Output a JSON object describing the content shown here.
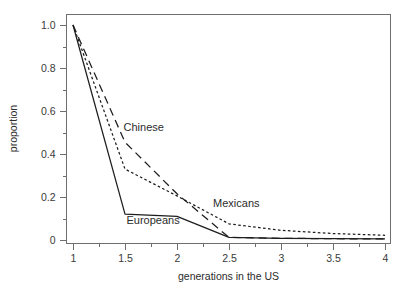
{
  "chart_data": {
    "type": "line",
    "title": "",
    "xlabel": "generations in the US",
    "ylabel": "proportion",
    "xlim": [
      1,
      4
    ],
    "ylim": [
      0,
      1.0
    ],
    "grid": false,
    "legend_position": "inline-annotations",
    "x_ticks": [
      {
        "value": 1,
        "label": "1"
      },
      {
        "value": 1.5,
        "label": "1.5"
      },
      {
        "value": 2,
        "label": "2"
      },
      {
        "value": 2.5,
        "label": "2.5"
      },
      {
        "value": 3,
        "label": "3"
      },
      {
        "value": 3.5,
        "label": "3.5"
      },
      {
        "value": 4,
        "label": "4"
      }
    ],
    "x_minor_ticks": [
      1.25,
      1.75,
      2.25,
      2.75,
      3.25,
      3.75
    ],
    "y_ticks": [
      {
        "value": 0,
        "label": "0"
      },
      {
        "value": 0.2,
        "label": "0.2"
      },
      {
        "value": 0.4,
        "label": "0.4"
      },
      {
        "value": 0.6,
        "label": "0.6"
      },
      {
        "value": 0.8,
        "label": "0.8"
      },
      {
        "value": 1.0,
        "label": "1.0"
      }
    ],
    "y_minor_ticks": [
      0.1,
      0.3,
      0.5,
      0.7,
      0.9
    ],
    "x": [
      1,
      1.5,
      2,
      2.5,
      3,
      3.5,
      4
    ],
    "series": [
      {
        "name": "Europeans",
        "style": "solid",
        "color": "#1d1d1d",
        "values": [
          1.0,
          0.12,
          0.11,
          0.012,
          0.008,
          0.006,
          0.005
        ],
        "label_x": 1.77,
        "label_y": 0.075
      },
      {
        "name": "Mexicans",
        "style": "dotted",
        "color": "#1d1d1d",
        "values": [
          1.0,
          0.33,
          0.205,
          0.075,
          0.045,
          0.03,
          0.022
        ],
        "label_x": 2.57,
        "label_y": 0.155
      },
      {
        "name": "Chinese",
        "style": "dashed",
        "color": "#1d1d1d",
        "values": [
          1.0,
          0.455,
          0.215,
          0.012,
          0.008,
          0.006,
          0.005
        ],
        "label_x": 1.68,
        "label_y": 0.505
      }
    ]
  }
}
